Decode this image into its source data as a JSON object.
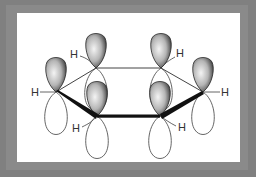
{
  "diagram": {
    "title": "",
    "colors": {
      "frame": "#808080",
      "panel": "#ffffff",
      "bond": "#111111",
      "thin_bond": "#444444",
      "lobe_dark": "#3a3a3a",
      "lobe_light": "#e8e8e8",
      "label": "#333333"
    },
    "atoms": [
      {
        "id": "C1",
        "x": 96,
        "y": 68
      },
      {
        "id": "C2",
        "x": 161,
        "y": 68
      },
      {
        "id": "C3",
        "x": 56,
        "y": 92
      },
      {
        "id": "C4",
        "x": 203,
        "y": 92
      },
      {
        "id": "C5",
        "x": 97,
        "y": 116
      },
      {
        "id": "C6",
        "x": 160,
        "y": 116
      }
    ],
    "bonds": [
      {
        "from": "C1",
        "to": "C2",
        "style": "thin"
      },
      {
        "from": "C1",
        "to": "C3",
        "style": "thin"
      },
      {
        "from": "C2",
        "to": "C4",
        "style": "thin"
      },
      {
        "from": "C3",
        "to": "C5",
        "style": "thick"
      },
      {
        "from": "C5",
        "to": "C6",
        "style": "thick"
      },
      {
        "from": "C6",
        "to": "C4",
        "style": "thick"
      }
    ],
    "hydrogens": [
      {
        "label": "H",
        "atom": "C3",
        "x": 31,
        "y": 96
      },
      {
        "label": "H",
        "atom": "C1",
        "x": 70,
        "y": 58
      },
      {
        "label": "H",
        "atom": "C2",
        "x": 176,
        "y": 57
      },
      {
        "label": "H",
        "atom": "C4",
        "x": 221,
        "y": 96
      },
      {
        "label": "H",
        "atom": "C5",
        "x": 72,
        "y": 132
      },
      {
        "label": "H",
        "atom": "C6",
        "x": 178,
        "y": 131
      }
    ]
  }
}
